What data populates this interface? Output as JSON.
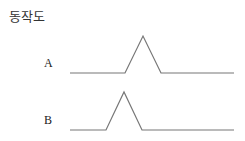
{
  "title": "동작도",
  "signals": [
    {
      "label": "A",
      "points": [
        [
          70,
          73
        ],
        [
          125,
          73
        ],
        [
          143,
          36
        ],
        [
          161,
          73
        ],
        [
          234,
          73
        ]
      ]
    },
    {
      "label": "B",
      "points": [
        [
          70,
          130
        ],
        [
          106,
          130
        ],
        [
          124,
          92
        ],
        [
          142,
          130
        ],
        [
          234,
          130
        ]
      ]
    }
  ],
  "colors": {
    "line": "#777777"
  }
}
